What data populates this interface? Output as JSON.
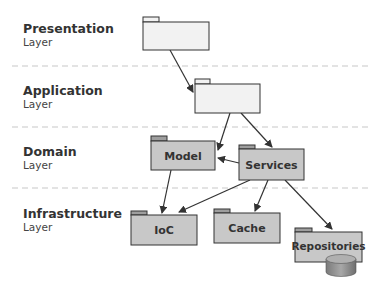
{
  "layers": [
    {
      "title": "Presentation",
      "subtitle": "Layer"
    },
    {
      "title": "Application",
      "subtitle": "Layer"
    },
    {
      "title": "Domain",
      "subtitle": "Layer"
    },
    {
      "title": "Infrastructure",
      "subtitle": "Layer"
    }
  ],
  "packages": {
    "presentation": {
      "label": ""
    },
    "application": {
      "label": ""
    },
    "model": {
      "label": "Model"
    },
    "services": {
      "label": "Services"
    },
    "ioc": {
      "label": "IoC"
    },
    "cache": {
      "label": "Cache"
    },
    "repositories": {
      "label": "Repositories"
    }
  },
  "colors": {
    "empty_fill": "#f2f2f2",
    "filled_fill": "#c8c8c8",
    "tab_fill": "#9e9e9e",
    "stroke": "#333333",
    "divider": "#c8c8c8"
  }
}
